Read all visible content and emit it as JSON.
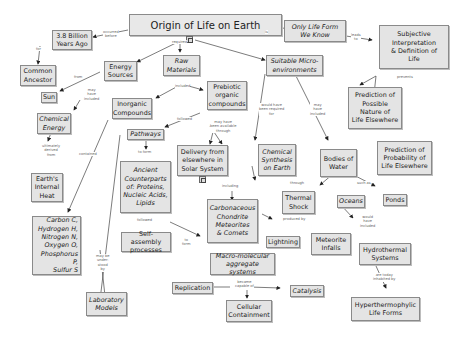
{
  "title": "Origin of Life on Earth",
  "nodes": {
    "origin": "Origin of Life on Earth",
    "billion": "3.8 Billion\nYears Ago",
    "ancestor": "Common\nAncestor",
    "only": "Only Life Form\nWe Know",
    "subjective": "Subjective\nInterpretation\n& Definition of\nLife",
    "energy": "Energy\nSources",
    "sun": "Sun",
    "chemical_energy": "Chemical\nEnergy",
    "earth_heat": "Earth's\nInternal\nHeat",
    "raw": "Raw\nMaterials",
    "inorganic": "Inorganic\nCompounds",
    "prebiotic": "Prebiotic\norganic\ncompounds",
    "suitable": "Suitable Micro-\nenvironments",
    "pred_possible": "Prediction of\nPossible\nNature of\nLife Elsewhere",
    "pred_prob": "Prediction of\nProbability of\nLife Elsewhere",
    "pathways": "Pathways",
    "ancient": "Ancient\nCounterparts\nof: Proteins,\nNucleic Acids,\nLipids",
    "delivery": "Delivery from\nelsewhere in\nSolar System",
    "chem_synth": "Chemical\nSynthesis\non Earth",
    "bodies": "Bodies of\nWater",
    "elements": "Carbon C,\nHydrogen H,\nNitrogen N,\nOxygen O,\nPhosphorus P,\nSulfur S",
    "carbonaceous": "Carbonaceous\nChondrite\nMeteorites\n& Comets",
    "thermal": "Thermal\nShock",
    "oceans": "Oceans",
    "ponds": "Ponds",
    "self_assembly": "Self-assembly\nprocesses",
    "lightning": "Lightning",
    "meteorite": "Meteorite\nInfalls",
    "hydrothermal": "Hydrothermal\nSystems",
    "macro": "Macro-molecular\naggregate systems",
    "lab": "Laboratory\nModels",
    "replication": "Replication",
    "catalysis": "Catalysis",
    "cellular": "Cellular\nContainment",
    "hyper": "Hyperthermophylic\nLife Forms"
  },
  "links": {
    "occurred_before": "occurred\nbefore",
    "for": "for",
    "is": "is",
    "leads_to": "leads\nto",
    "required": "required",
    "prevents": "prevents",
    "from": "from",
    "may_have_included_1": "may\nhave\nincluded",
    "ultimately": "ultimately\nderived\nfrom",
    "included": "included",
    "followed_1": "followed",
    "contained": "contained",
    "to_form_1": "to form",
    "may_have_been": "may have\nbeen available\nthrough",
    "would_have_been": "would have\nbeen required\nfor",
    "may_have_included_2": "may\nhave\nincluded",
    "including": "including",
    "through": "through",
    "such_as": "such as",
    "followed_2": "followed",
    "produced_by": "produced by",
    "would_have_included": "would\nhave\nincluded",
    "to_form_2": "to\nform",
    "may_be_understood": "may be\nunder-\nstood\nby",
    "became_capable": "became\ncapable of",
    "are_today": "are today\ninhabited by"
  },
  "colors": {
    "node_fill": "#e4e4e4",
    "node_border": "#8a8a8a",
    "line": "#333333",
    "link_text": "#666666"
  }
}
